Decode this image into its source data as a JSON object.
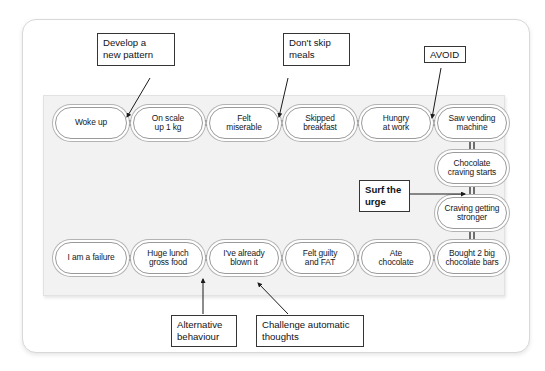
{
  "diagram": {
    "chain_top": [
      {
        "id": "woke-up",
        "label": "Woke up"
      },
      {
        "id": "on-scale",
        "label": "On scale\nup 1 kg"
      },
      {
        "id": "felt-miserable",
        "label": "Felt\nmiserable"
      },
      {
        "id": "skipped-breakfast",
        "label": "Skipped\nbreakfast"
      },
      {
        "id": "hungry-at-work",
        "label": "Hungry\nat work"
      },
      {
        "id": "saw-vending-machine",
        "label": "Saw vending\nmachine"
      }
    ],
    "chain_right": [
      {
        "id": "chocolate-craving-starts",
        "label": "Chocolate\ncraving starts"
      },
      {
        "id": "craving-getting-stronger",
        "label": "Craving getting\nstronger"
      }
    ],
    "chain_bottom": [
      {
        "id": "i-am-a-failure",
        "label": "I am a failure"
      },
      {
        "id": "huge-lunch",
        "label": "Huge lunch\ngross food"
      },
      {
        "id": "already-blown-it",
        "label": "I've already\nblown it"
      },
      {
        "id": "felt-guilty",
        "label": "Felt guilty\nand FAT"
      },
      {
        "id": "ate-chocolate",
        "label": "Ate\nchocolate"
      },
      {
        "id": "bought-2-big-bars",
        "label": "Bought 2 big\nchocolate bars"
      }
    ],
    "callouts": [
      {
        "id": "develop-a-new-pattern",
        "label": "Develop a\nnew pattern",
        "bold": false
      },
      {
        "id": "dont-skip-meals",
        "label": "Don't skip\nmeals",
        "bold": false
      },
      {
        "id": "avoid",
        "label": "AVOID",
        "bold": false
      },
      {
        "id": "surf-the-urge",
        "label": "Surf the\nurge",
        "bold": true
      },
      {
        "id": "alternative-behaviour",
        "label": "Alternative\nbehaviour",
        "bold": false
      },
      {
        "id": "challenge-automatic-thoughts",
        "label": "Challenge automatic\nthoughts",
        "bold": false
      }
    ],
    "colors": {
      "page_background": "#ffffff",
      "card_background": "#ffffff",
      "panel_background": "#f2f2f2",
      "node_border": "#9a9a9a",
      "node_outer_ring": "#b3b3b3",
      "connector": "#6e6e6e",
      "callout_border": "#353535",
      "text": "#15181c",
      "leader_line": "#1b1b1b"
    }
  }
}
